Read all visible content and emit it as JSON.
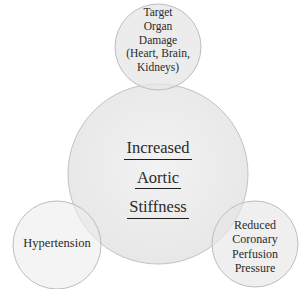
{
  "diagram": {
    "type": "venn-style-overlapping-circles",
    "center_node": {
      "lines": [
        "Increased",
        "Aortic",
        "Stiffness"
      ],
      "underlined": true
    },
    "satellite_nodes": [
      {
        "id": "top",
        "lines": [
          "Target",
          "Organ",
          "Damage",
          "(Heart, Brain,",
          "Kidneys)"
        ]
      },
      {
        "id": "left",
        "lines": [
          "Hypertension"
        ]
      },
      {
        "id": "right",
        "lines": [
          "Reduced",
          "Coronary",
          "Perfusion",
          "Pressure"
        ]
      }
    ],
    "colors": {
      "circle_fill": "#e9e9e9",
      "circle_stroke": "#bdbdbd",
      "overlap_fill": "#d6d6d6",
      "text": "#2a2a2a",
      "background": "#ffffff"
    }
  }
}
